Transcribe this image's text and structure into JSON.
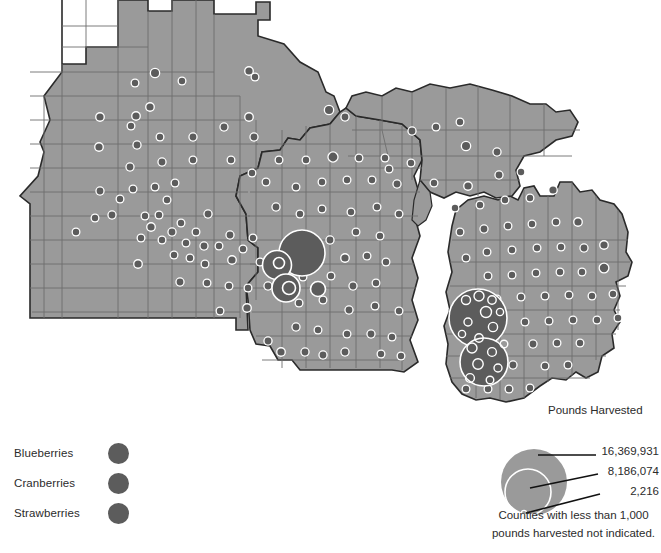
{
  "figure": {
    "name": "berry-production-map",
    "region": "Minnesota, Wisconsin, Michigan"
  },
  "type_legend": {
    "items": [
      {
        "label": "Blueberries",
        "color": "#5c5c5c"
      },
      {
        "label": "Cranberries",
        "color": "#5c5c5c"
      },
      {
        "label": "Strawberries",
        "color": "#5c5c5c"
      }
    ]
  },
  "size_legend": {
    "title": "Pounds Harvested",
    "large_value": "16,369,931",
    "mid_value": "8,186,074",
    "small_value": "2,216"
  },
  "caption": {
    "line1": "Counties with less than 1,000",
    "line2": "pounds harvested not indicated."
  },
  "colors": {
    "land": "#9a9a9a",
    "land_stroke": "#6d6d6d",
    "state_stroke": "#2a2a2a",
    "symbol": "#5c5c5c",
    "symbol_outline": "#ffffff",
    "water": "#ffffff",
    "text": "#2b2b2b"
  },
  "chart_data": {
    "type": "scatter",
    "title": "Pounds Harvested",
    "legend_breaks": [
      16369931,
      8186074,
      2216
    ],
    "note": "Counties with less than 1,000 pounds harvested not indicated.",
    "series": [
      {
        "name": "Blueberries",
        "color": "#5c5c5c"
      },
      {
        "name": "Cranberries",
        "color": "#5c5c5c"
      },
      {
        "name": "Strawberries",
        "color": "#5c5c5c"
      }
    ],
    "symbols": [
      {
        "x": 155,
        "y": 73,
        "r": 4.0
      },
      {
        "x": 150,
        "y": 107,
        "r": 3.6
      },
      {
        "x": 249,
        "y": 71,
        "r": 3.6
      },
      {
        "x": 182,
        "y": 81,
        "r": 3.2
      },
      {
        "x": 135,
        "y": 83,
        "r": 3.2
      },
      {
        "x": 255,
        "y": 77,
        "r": 3.2
      },
      {
        "x": 136,
        "y": 116,
        "r": 3.6
      },
      {
        "x": 100,
        "y": 117,
        "r": 3.6
      },
      {
        "x": 99,
        "y": 147,
        "r": 3.6
      },
      {
        "x": 131,
        "y": 126,
        "r": 3.2
      },
      {
        "x": 160,
        "y": 137,
        "r": 3.2
      },
      {
        "x": 137,
        "y": 145,
        "r": 3.4
      },
      {
        "x": 193,
        "y": 137,
        "r": 3.4
      },
      {
        "x": 193,
        "y": 160,
        "r": 3.2
      },
      {
        "x": 224,
        "y": 127,
        "r": 3.4
      },
      {
        "x": 249,
        "y": 117,
        "r": 3.6
      },
      {
        "x": 254,
        "y": 137,
        "r": 3.4
      },
      {
        "x": 231,
        "y": 160,
        "r": 3.2
      },
      {
        "x": 252,
        "y": 173,
        "r": 3.2
      },
      {
        "x": 130,
        "y": 167,
        "r": 3.4
      },
      {
        "x": 133,
        "y": 189,
        "r": 3.2
      },
      {
        "x": 100,
        "y": 191,
        "r": 3.4
      },
      {
        "x": 162,
        "y": 162,
        "r": 3.4
      },
      {
        "x": 155,
        "y": 187,
        "r": 3.2
      },
      {
        "x": 175,
        "y": 183,
        "r": 3.2
      },
      {
        "x": 167,
        "y": 200,
        "r": 3.2
      },
      {
        "x": 120,
        "y": 199,
        "r": 3.2
      },
      {
        "x": 112,
        "y": 215,
        "r": 3.4
      },
      {
        "x": 95,
        "y": 218,
        "r": 3.2
      },
      {
        "x": 145,
        "y": 216,
        "r": 3.2
      },
      {
        "x": 159,
        "y": 215,
        "r": 3.2
      },
      {
        "x": 151,
        "y": 227,
        "r": 3.6
      },
      {
        "x": 141,
        "y": 238,
        "r": 3.2
      },
      {
        "x": 162,
        "y": 240,
        "r": 3.2
      },
      {
        "x": 172,
        "y": 232,
        "r": 3.4
      },
      {
        "x": 181,
        "y": 223,
        "r": 3.2
      },
      {
        "x": 186,
        "y": 243,
        "r": 3.2
      },
      {
        "x": 196,
        "y": 232,
        "r": 3.2
      },
      {
        "x": 76,
        "y": 232,
        "r": 3.2
      },
      {
        "x": 208,
        "y": 214,
        "r": 3.4
      },
      {
        "x": 204,
        "y": 246,
        "r": 3.4
      },
      {
        "x": 219,
        "y": 246,
        "r": 3.2
      },
      {
        "x": 230,
        "y": 235,
        "r": 3.4
      },
      {
        "x": 174,
        "y": 255,
        "r": 3.2
      },
      {
        "x": 190,
        "y": 258,
        "r": 3.2
      },
      {
        "x": 205,
        "y": 264,
        "r": 3.2
      },
      {
        "x": 232,
        "y": 260,
        "r": 3.6
      },
      {
        "x": 243,
        "y": 249,
        "r": 3.2
      },
      {
        "x": 253,
        "y": 238,
        "r": 3.2
      },
      {
        "x": 260,
        "y": 262,
        "r": 3.2
      },
      {
        "x": 138,
        "y": 264,
        "r": 3.6
      },
      {
        "x": 180,
        "y": 282,
        "r": 3.4
      },
      {
        "x": 207,
        "y": 283,
        "r": 3.2
      },
      {
        "x": 229,
        "y": 286,
        "r": 3.2
      },
      {
        "x": 248,
        "y": 288,
        "r": 3.2
      },
      {
        "x": 268,
        "y": 286,
        "r": 3.4
      },
      {
        "x": 247,
        "y": 308,
        "r": 3.6
      },
      {
        "x": 220,
        "y": 311,
        "r": 3.2
      },
      {
        "x": 281,
        "y": 352,
        "r": 3.6
      },
      {
        "x": 305,
        "y": 352,
        "r": 3.4
      },
      {
        "x": 268,
        "y": 341,
        "r": 3.4
      },
      {
        "x": 296,
        "y": 327,
        "r": 3.4
      },
      {
        "x": 318,
        "y": 330,
        "r": 3.2
      },
      {
        "x": 323,
        "y": 355,
        "r": 3.4
      },
      {
        "x": 345,
        "y": 352,
        "r": 3.4
      },
      {
        "x": 347,
        "y": 334,
        "r": 3.2
      },
      {
        "x": 371,
        "y": 334,
        "r": 3.4
      },
      {
        "x": 392,
        "y": 337,
        "r": 3.2
      },
      {
        "x": 381,
        "y": 354,
        "r": 3.2
      },
      {
        "x": 401,
        "y": 356,
        "r": 3.2
      },
      {
        "x": 349,
        "y": 310,
        "r": 3.4
      },
      {
        "x": 375,
        "y": 306,
        "r": 3.2
      },
      {
        "x": 399,
        "y": 311,
        "r": 3.2
      },
      {
        "x": 323,
        "y": 300,
        "r": 3.2
      },
      {
        "x": 299,
        "y": 303,
        "r": 3.2
      },
      {
        "x": 353,
        "y": 286,
        "r": 3.4
      },
      {
        "x": 376,
        "y": 283,
        "r": 3.2
      },
      {
        "x": 331,
        "y": 276,
        "r": 3.2
      },
      {
        "x": 303,
        "y": 277,
        "r": 3.2
      },
      {
        "x": 345,
        "y": 258,
        "r": 3.6
      },
      {
        "x": 367,
        "y": 256,
        "r": 3.2
      },
      {
        "x": 386,
        "y": 262,
        "r": 3.2
      },
      {
        "x": 330,
        "y": 240,
        "r": 3.4
      },
      {
        "x": 356,
        "y": 232,
        "r": 3.2
      },
      {
        "x": 380,
        "y": 236,
        "r": 3.2
      },
      {
        "x": 351,
        "y": 212,
        "r": 3.2
      },
      {
        "x": 377,
        "y": 207,
        "r": 3.2
      },
      {
        "x": 399,
        "y": 214,
        "r": 3.2
      },
      {
        "x": 322,
        "y": 209,
        "r": 3.2
      },
      {
        "x": 300,
        "y": 214,
        "r": 3.2
      },
      {
        "x": 276,
        "y": 207,
        "r": 3.4
      },
      {
        "x": 296,
        "y": 187,
        "r": 3.2
      },
      {
        "x": 322,
        "y": 182,
        "r": 3.2
      },
      {
        "x": 347,
        "y": 180,
        "r": 3.2
      },
      {
        "x": 372,
        "y": 180,
        "r": 3.2
      },
      {
        "x": 397,
        "y": 184,
        "r": 3.4
      },
      {
        "x": 266,
        "y": 182,
        "r": 3.2
      },
      {
        "x": 306,
        "y": 160,
        "r": 3.2
      },
      {
        "x": 333,
        "y": 157,
        "r": 4.4
      },
      {
        "x": 359,
        "y": 158,
        "r": 3.2
      },
      {
        "x": 385,
        "y": 158,
        "r": 3.2
      },
      {
        "x": 411,
        "y": 163,
        "r": 3.2
      },
      {
        "x": 279,
        "y": 160,
        "r": 3.2
      },
      {
        "x": 329,
        "y": 110,
        "r": 4.0
      },
      {
        "x": 345,
        "y": 117,
        "r": 3.4
      },
      {
        "x": 412,
        "y": 131,
        "r": 3.4
      },
      {
        "x": 436,
        "y": 127,
        "r": 3.2
      },
      {
        "x": 460,
        "y": 122,
        "r": 3.2
      },
      {
        "x": 466,
        "y": 146,
        "r": 4.0
      },
      {
        "x": 497,
        "y": 152,
        "r": 3.4
      },
      {
        "x": 499,
        "y": 175,
        "r": 3.4
      },
      {
        "x": 521,
        "y": 172,
        "r": 3.2
      },
      {
        "x": 389,
        "y": 169,
        "r": 3.2
      },
      {
        "x": 434,
        "y": 183,
        "r": 3.2
      },
      {
        "x": 468,
        "y": 186,
        "r": 3.6
      },
      {
        "x": 455,
        "y": 208,
        "r": 3.2
      },
      {
        "x": 480,
        "y": 205,
        "r": 3.2
      },
      {
        "x": 505,
        "y": 200,
        "r": 3.2
      },
      {
        "x": 530,
        "y": 198,
        "r": 3.2
      },
      {
        "x": 553,
        "y": 190,
        "r": 3.6
      },
      {
        "x": 484,
        "y": 229,
        "r": 3.4
      },
      {
        "x": 508,
        "y": 226,
        "r": 3.2
      },
      {
        "x": 532,
        "y": 224,
        "r": 3.2
      },
      {
        "x": 556,
        "y": 222,
        "r": 3.2
      },
      {
        "x": 578,
        "y": 222,
        "r": 3.6
      },
      {
        "x": 460,
        "y": 232,
        "r": 3.2
      },
      {
        "x": 487,
        "y": 252,
        "r": 3.2
      },
      {
        "x": 512,
        "y": 250,
        "r": 3.2
      },
      {
        "x": 537,
        "y": 248,
        "r": 3.2
      },
      {
        "x": 561,
        "y": 247,
        "r": 3.2
      },
      {
        "x": 584,
        "y": 248,
        "r": 3.4
      },
      {
        "x": 604,
        "y": 245,
        "r": 3.6
      },
      {
        "x": 604,
        "y": 268,
        "r": 4.2
      },
      {
        "x": 582,
        "y": 272,
        "r": 3.2
      },
      {
        "x": 560,
        "y": 272,
        "r": 3.2
      },
      {
        "x": 536,
        "y": 273,
        "r": 3.2
      },
      {
        "x": 512,
        "y": 275,
        "r": 3.2
      },
      {
        "x": 488,
        "y": 276,
        "r": 3.2
      },
      {
        "x": 466,
        "y": 258,
        "r": 3.2
      },
      {
        "x": 497,
        "y": 299,
        "r": 3.2
      },
      {
        "x": 521,
        "y": 297,
        "r": 3.2
      },
      {
        "x": 545,
        "y": 296,
        "r": 3.2
      },
      {
        "x": 569,
        "y": 295,
        "r": 3.2
      },
      {
        "x": 592,
        "y": 296,
        "r": 3.2
      },
      {
        "x": 613,
        "y": 294,
        "r": 3.2
      },
      {
        "x": 618,
        "y": 318,
        "r": 3.2
      },
      {
        "x": 597,
        "y": 320,
        "r": 3.2
      },
      {
        "x": 573,
        "y": 320,
        "r": 3.2
      },
      {
        "x": 549,
        "y": 321,
        "r": 3.2
      },
      {
        "x": 525,
        "y": 322,
        "r": 3.2
      },
      {
        "x": 533,
        "y": 344,
        "r": 3.4
      },
      {
        "x": 557,
        "y": 343,
        "r": 3.2
      },
      {
        "x": 580,
        "y": 343,
        "r": 3.2
      },
      {
        "x": 545,
        "y": 366,
        "r": 3.2
      },
      {
        "x": 568,
        "y": 365,
        "r": 3.2
      },
      {
        "x": 513,
        "y": 365,
        "r": 3.4
      },
      {
        "x": 491,
        "y": 344,
        "r": 3.2
      },
      {
        "x": 509,
        "y": 389,
        "r": 3.2
      },
      {
        "x": 488,
        "y": 389,
        "r": 3.2
      },
      {
        "x": 466,
        "y": 389,
        "r": 3.2
      },
      {
        "x": 530,
        "y": 388,
        "r": 3.2
      }
    ],
    "large_symbols": [
      {
        "x": 302,
        "y": 253,
        "r": 23.0,
        "label": "cranberry-cluster-primary"
      },
      {
        "x": 277,
        "y": 265,
        "r": 14.5,
        "label": "cranberry-cluster-west"
      },
      {
        "x": 286,
        "y": 288,
        "r": 14.0,
        "label": "cranberry-cluster-south"
      },
      {
        "x": 289,
        "y": 288,
        "r": 6.5,
        "label": "cranberry-inner-south"
      },
      {
        "x": 279,
        "y": 263,
        "r": 5.5,
        "label": "cranberry-inner-west"
      },
      {
        "x": 318,
        "y": 289,
        "r": 7.5,
        "label": "cranberry-east"
      },
      {
        "x": 478,
        "y": 318,
        "r": 29.0,
        "label": "blueberry-cluster-north"
      },
      {
        "x": 484,
        "y": 362,
        "r": 24.0,
        "label": "blueberry-cluster-south"
      }
    ]
  }
}
